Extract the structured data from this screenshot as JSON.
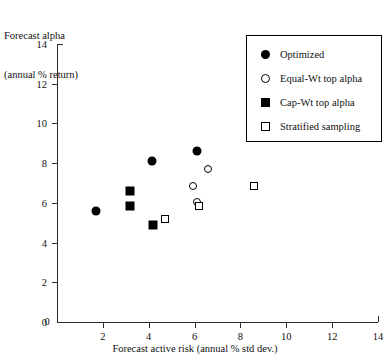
{
  "chart_data": {
    "type": "scatter",
    "title": "",
    "ylabel_lines": [
      "Forecast alpha",
      "(annual % return)"
    ],
    "xlabel": "Forecast active risk (annual % std dev.)",
    "xlim": [
      0,
      14
    ],
    "ylim": [
      0,
      14
    ],
    "xticks": [
      0,
      2,
      4,
      6,
      8,
      10,
      12,
      14
    ],
    "yticks": [
      0,
      2,
      4,
      6,
      8,
      10,
      12,
      14
    ],
    "xtick_labels": [
      "0",
      "2",
      "4",
      "6",
      "8",
      "10",
      "12",
      "14"
    ],
    "ytick_labels": [
      "0",
      "2",
      "4",
      "6",
      "8",
      "10",
      "12",
      "14"
    ],
    "grid": false,
    "legend_position": "top-right",
    "series": [
      {
        "name": "Optimized",
        "marker": "circle-filled",
        "points": [
          {
            "x": 1.7,
            "y": 5.6
          },
          {
            "x": 4.15,
            "y": 8.1
          },
          {
            "x": 6.1,
            "y": 8.6
          }
        ]
      },
      {
        "name": "Equal-Wt top alpha",
        "marker": "circle-open",
        "points": [
          {
            "x": 6.6,
            "y": 7.7
          },
          {
            "x": 5.95,
            "y": 6.85
          },
          {
            "x": 6.1,
            "y": 6.05
          }
        ]
      },
      {
        "name": "Cap-Wt top alpha",
        "marker": "square-filled",
        "points": [
          {
            "x": 3.2,
            "y": 6.6
          },
          {
            "x": 3.2,
            "y": 5.85
          },
          {
            "x": 4.2,
            "y": 4.9
          }
        ]
      },
      {
        "name": "Stratified sampling",
        "marker": "square-open",
        "points": [
          {
            "x": 4.7,
            "y": 5.2
          },
          {
            "x": 6.2,
            "y": 5.85
          },
          {
            "x": 8.6,
            "y": 6.85
          }
        ]
      }
    ]
  },
  "legend": {
    "items": [
      {
        "label": "Optimized",
        "marker": "circle-filled"
      },
      {
        "label": "Equal-Wt top alpha",
        "marker": "circle-open"
      },
      {
        "label": "Cap-Wt top alpha",
        "marker": "square-filled"
      },
      {
        "label": "Stratified sampling",
        "marker": "square-open"
      }
    ]
  },
  "colors": {
    "marker": "#000000",
    "axis": "#2b2b2b",
    "background": "#ffffff"
  }
}
